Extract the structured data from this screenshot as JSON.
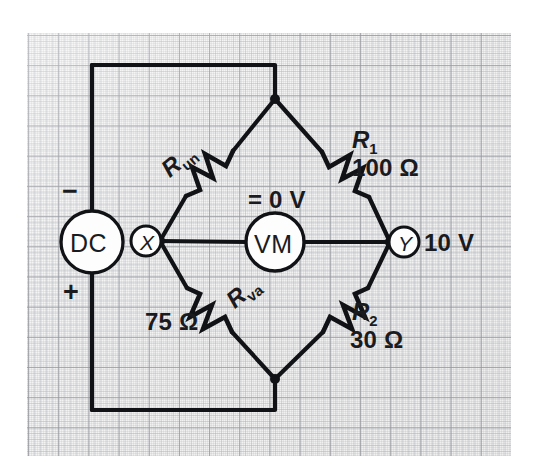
{
  "figure": {
    "type": "circuit-schematic",
    "background": "#f4f4f4",
    "line_color": "#111216"
  },
  "source": {
    "label": "DC",
    "negative_sign": "−",
    "positive_sign": "+"
  },
  "terminals": {
    "left": {
      "label": "X"
    },
    "right": {
      "label": "Y",
      "voltage": "10 V"
    }
  },
  "meter": {
    "label": "VM",
    "reading": "= 0 V"
  },
  "resistors": [
    {
      "id": "r-un",
      "symbol": "R",
      "subscript": "un",
      "value": "",
      "position": "upper-left"
    },
    {
      "id": "r-one",
      "symbol": "R",
      "subscript": "1",
      "value": "100 Ω",
      "position": "upper-right"
    },
    {
      "id": "r-va",
      "symbol": "R",
      "subscript": "va",
      "value": "75 Ω",
      "position": "lower-left"
    },
    {
      "id": "r-two",
      "symbol": "R",
      "subscript": "2",
      "value": "30 Ω",
      "position": "lower-right"
    }
  ]
}
